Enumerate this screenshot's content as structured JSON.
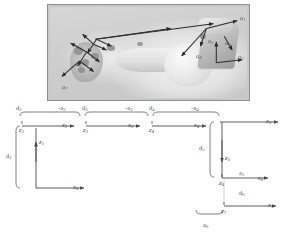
{
  "figure": {
    "name": "kinematic-chain-figure",
    "background_color": "#ffffff",
    "photo": {
      "name": "specimen-photograph",
      "alt_description": "Grayscale photograph of a skeletal specimen mounted in a fixture with coordinate frame arrows overlaid",
      "border_color": "#8e8e8e",
      "fill_color": "#c9c9c9",
      "vector_color": "#2a2a2a",
      "vector_labels": [
        {
          "id": "p-a1",
          "text": "a",
          "sub": "1"
        },
        {
          "id": "p-a2",
          "text": "a",
          "sub": "2"
        },
        {
          "id": "p-a3",
          "text": "a",
          "sub": "3"
        },
        {
          "id": "p-a4",
          "text": "a",
          "sub": "4"
        },
        {
          "id": "p-a5",
          "text": "a",
          "sub": "5"
        },
        {
          "id": "p-a6",
          "text": "a",
          "sub": "6"
        },
        {
          "id": "p-a7",
          "text": "a",
          "sub": "7"
        }
      ]
    },
    "diagram": {
      "name": "dh-parameter-diagram",
      "line_color": "#4a4a4a",
      "top_row": {
        "dimensions": [
          {
            "id": "d2",
            "text": "d",
            "sub": "2"
          },
          {
            "id": "-a2",
            "text": "-a",
            "sub": "2"
          },
          {
            "id": "d3",
            "text": "d",
            "sub": "3"
          },
          {
            "id": "-a3",
            "text": "-a",
            "sub": "3"
          },
          {
            "id": "d4",
            "text": "d",
            "sub": "4"
          },
          {
            "id": "-a4",
            "text": "-a",
            "sub": "4"
          }
        ],
        "frames": [
          {
            "id": "f2",
            "z": "z",
            "z_sub": "2",
            "x": "x",
            "x_sub": "2"
          },
          {
            "id": "f3",
            "z": "z",
            "z_sub": "3",
            "x": "x",
            "x_sub": "3"
          },
          {
            "id": "f4",
            "z": "z",
            "z_sub": "4",
            "x": "x",
            "x_sub": "4"
          },
          {
            "id": "f5",
            "z": "z",
            "z_sub": "5",
            "x": "x",
            "x_sub": "5"
          }
        ]
      },
      "left_branch": {
        "dimension": {
          "id": "d1",
          "text": "d",
          "sub": "1"
        },
        "z_axis": {
          "text": "z",
          "sub": "1"
        },
        "x_axis": {
          "text": "x",
          "sub": "0"
        }
      },
      "right_branch": {
        "dimension": {
          "id": "d5",
          "text": "d",
          "sub": "5"
        },
        "z_axis": {
          "text": "z",
          "sub": "5"
        },
        "frame6": {
          "z": "z",
          "z_sub": "6",
          "x": "x",
          "x_sub": "6"
        },
        "a5": {
          "text": "a",
          "sub": "5"
        },
        "d6": {
          "text": "d",
          "sub": "6"
        }
      },
      "bottom_branch": {
        "frame7": {
          "z": "z",
          "z_sub": "7",
          "x": "x",
          "x_sub": "7"
        },
        "a6": {
          "text": "a",
          "sub": "6"
        }
      }
    }
  }
}
